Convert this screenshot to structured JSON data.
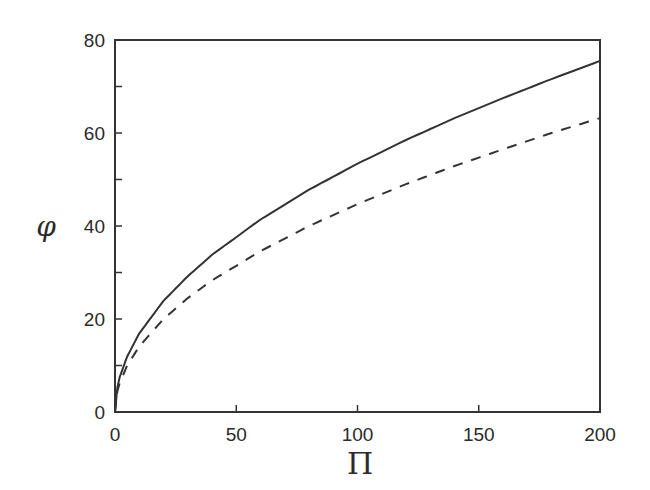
{
  "chart_data": {
    "type": "line",
    "title": "",
    "xlabel": "Π",
    "ylabel": "φ",
    "xlim": [
      0,
      200
    ],
    "ylim": [
      0,
      80
    ],
    "x_ticks": [
      0,
      50,
      100,
      150,
      200
    ],
    "y_ticks": [
      0,
      20,
      40,
      60,
      80
    ],
    "y_minor_ticks": [
      10,
      30,
      50,
      70
    ],
    "grid": false,
    "legend": null,
    "x": [
      0,
      1,
      2,
      5,
      10,
      20,
      30,
      40,
      60,
      80,
      100,
      120,
      140,
      160,
      180,
      200
    ],
    "series": [
      {
        "name": "solid",
        "style": "solid",
        "values": [
          0,
          5.3,
          7.6,
          11.9,
          16.9,
          23.9,
          29.2,
          33.8,
          41.4,
          47.8,
          53.4,
          58.5,
          63.2,
          67.5,
          71.6,
          75.5
        ]
      },
      {
        "name": "dashed",
        "style": "dashed",
        "values": [
          0,
          4.5,
          6.3,
          10.0,
          14.1,
          20.0,
          24.5,
          28.3,
          34.6,
          40.0,
          44.7,
          49.0,
          52.9,
          56.5,
          60.0,
          63.2
        ]
      }
    ]
  },
  "colors": {
    "line": "#333333",
    "axis": "#333333",
    "text": "#2a2a2a"
  }
}
